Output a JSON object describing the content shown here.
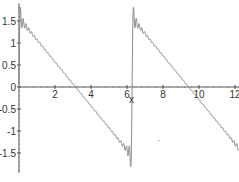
{
  "chart_data": {
    "type": "line",
    "title": "",
    "xlabel": "x",
    "ylabel": "",
    "xlim": [
      0,
      12.2
    ],
    "ylim": [
      -1.95,
      1.9
    ],
    "grid": false,
    "x_ticks": [
      2,
      4,
      6,
      8,
      10,
      12
    ],
    "x_tick_labels": [
      "2",
      "4",
      "6",
      "8",
      "10",
      "12"
    ],
    "y_ticks": [
      1.5,
      1,
      0.5,
      0,
      -0.5,
      -1,
      -1.5
    ],
    "y_tick_labels": [
      "1.5",
      "1",
      "0.5",
      "0",
      "-0.5",
      "-1",
      "-1.5"
    ],
    "series": [
      {
        "name": "partial sum",
        "color": "#8a8a8a",
        "function": "sum_{n=1}^{N} sin(n x)/n",
        "x_samples": [
          0.05,
          1,
          2,
          3,
          3.1416,
          4,
          5,
          6,
          6.2,
          6.36,
          7,
          8,
          9,
          9.42,
          10,
          11,
          12,
          12.2
        ],
        "y_samples": [
          1.55,
          1.07,
          0.57,
          0.07,
          0.0,
          -0.43,
          -0.93,
          -1.43,
          -1.55,
          1.55,
          1.21,
          0.71,
          0.21,
          0.0,
          -0.29,
          -0.79,
          -1.29,
          -1.39
        ]
      }
    ],
    "jump_at_x": 6.2832
  }
}
